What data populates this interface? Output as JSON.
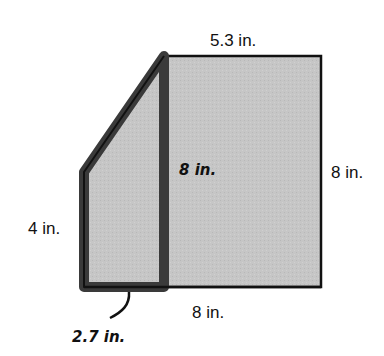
{
  "figure": {
    "colors": {
      "fill": "#c4c4c4",
      "outline": "#111111",
      "highlight_outline": "#3a3a3a",
      "background": "#ffffff"
    },
    "labels": {
      "rect_top": "5.3 in.",
      "rect_right": "8 in.",
      "rect_bottom": "8 in.",
      "trap_left": "4 in.",
      "shared_height": "8 in.",
      "trap_bottom": "2.7 in."
    }
  }
}
